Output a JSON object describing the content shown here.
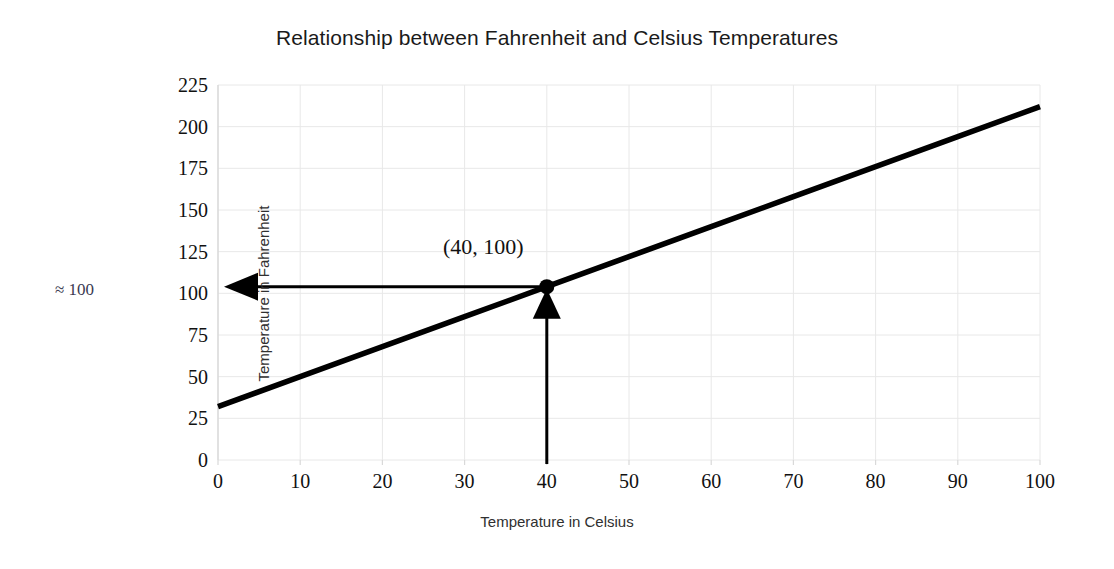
{
  "chart_data": {
    "type": "line",
    "title": "Relationship between Fahrenheit and Celsius Temperatures",
    "xlabel": "Temperature in Celsius",
    "ylabel": "Temperature in Fahrenheit",
    "xlim": [
      0,
      100
    ],
    "ylim": [
      0,
      225
    ],
    "grid": true,
    "legend": "none",
    "xticks": [
      0,
      10,
      20,
      30,
      40,
      50,
      60,
      70,
      80,
      90,
      100
    ],
    "yticks": [
      0,
      25,
      50,
      75,
      100,
      125,
      150,
      175,
      200,
      225
    ],
    "series": [
      {
        "name": "Fahrenheit vs Celsius",
        "relation": "F = 1.8C + 32",
        "color": "#000000",
        "x": [
          0,
          10,
          20,
          30,
          40,
          50,
          60,
          70,
          80,
          90,
          100
        ],
        "values": [
          32,
          50,
          68,
          86,
          104,
          122,
          140,
          158,
          176,
          194,
          212
        ]
      }
    ],
    "annotations": [
      {
        "name": "highlighted-point-label",
        "text": "(40, 100)",
        "x": 40,
        "y": 104
      },
      {
        "name": "y-axis-outside-note",
        "text": "≈  100",
        "y": 104
      }
    ],
    "markers": [
      {
        "name": "highlighted-point",
        "x": 40,
        "y": 104,
        "color": "#000000"
      }
    ],
    "arrows": [
      {
        "name": "vertical-guide-arrow",
        "from": [
          40,
          0
        ],
        "to": [
          40,
          104
        ],
        "direction": "up"
      },
      {
        "name": "horizontal-guide-arrow",
        "from": [
          40,
          104
        ],
        "to": [
          0,
          104
        ],
        "direction": "left"
      }
    ]
  },
  "colors": {
    "line": "#000000",
    "grid": "#e8e8e8",
    "spine": "#d9d9d9",
    "text": "#111111",
    "note": "#3a3a52",
    "background": "#ffffff"
  },
  "ytick_labels": [
    "225",
    "200",
    "175",
    "150",
    "125",
    "100",
    "75",
    "50",
    "25",
    "0"
  ],
  "xtick_labels": [
    "0",
    "10",
    "20",
    "30",
    "40",
    "50",
    "60",
    "70",
    "80",
    "90",
    "100"
  ]
}
